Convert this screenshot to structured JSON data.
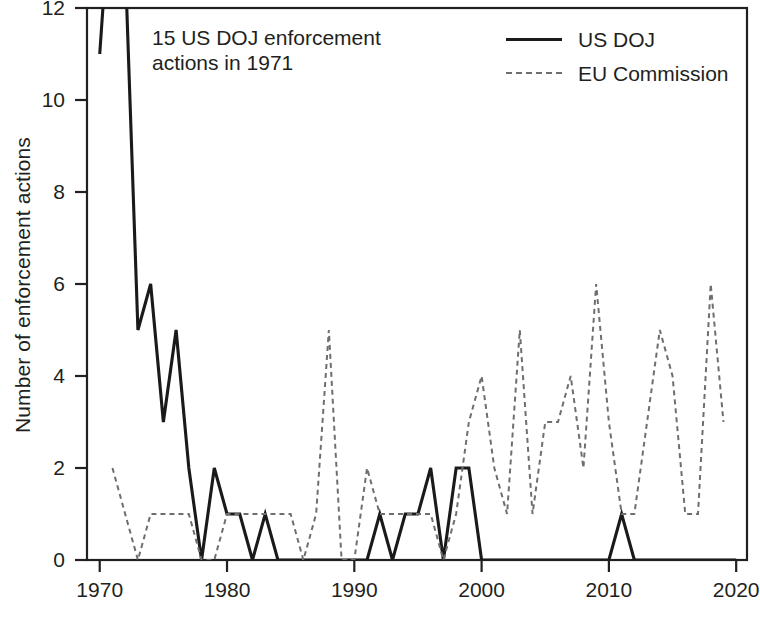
{
  "axes": {
    "ylabel": "Number of enforcement actions",
    "xlabel": "",
    "yticks": [
      0,
      2,
      4,
      6,
      8,
      10,
      12
    ],
    "xticks": [
      1970,
      1980,
      1990,
      2000,
      2010,
      2020
    ],
    "xtick_labels": [
      "1970",
      "1980",
      "1990",
      "2000",
      "2010",
      "2020"
    ],
    "ytick_labels": [
      "0",
      "2",
      "4",
      "6",
      "8",
      "10",
      "12"
    ]
  },
  "annotation": {
    "text": "15 US DOJ enforcement\nactions in 1971"
  },
  "legend": {
    "items": [
      {
        "label": "US DOJ",
        "style": "solid",
        "color": "#1a1a1a"
      },
      {
        "label": "EU Commission",
        "style": "dashed",
        "color": "#6e6e6e"
      }
    ]
  },
  "chart_data": {
    "type": "line",
    "title": "",
    "xlabel": "",
    "ylabel": "Number of enforcement actions",
    "xlim": [
      1969,
      2020
    ],
    "ylim": [
      0,
      12.5
    ],
    "grid": false,
    "legend_position": "top-right",
    "annotations": [
      {
        "text": "15 US DOJ enforcement actions in 1971",
        "x": 1973,
        "y": 11.6
      }
    ],
    "series": [
      {
        "name": "US DOJ",
        "style": "solid",
        "color": "#1a1a1a",
        "x": [
          1970,
          1971,
          1972,
          1973,
          1974,
          1975,
          1976,
          1977,
          1978,
          1979,
          1980,
          1981,
          1982,
          1983,
          1984,
          1985,
          1986,
          1987,
          1988,
          1989,
          1990,
          1991,
          1992,
          1993,
          1994,
          1995,
          1996,
          1997,
          1998,
          1999,
          2000,
          2001,
          2002,
          2003,
          2004,
          2005,
          2006,
          2007,
          2008,
          2009,
          2010,
          2011,
          2012,
          2013,
          2014,
          2015,
          2016,
          2017,
          2018,
          2019,
          2020
        ],
        "values": [
          11,
          15,
          13,
          5,
          6,
          3,
          5,
          2,
          0,
          2,
          1,
          1,
          0,
          1,
          0,
          0,
          0,
          0,
          0,
          0,
          0,
          0,
          1,
          0,
          1,
          1,
          2,
          0,
          2,
          2,
          0,
          0,
          0,
          0,
          0,
          0,
          0,
          0,
          0,
          0,
          0,
          1,
          0,
          0,
          0,
          0,
          0,
          0,
          0,
          0,
          0
        ]
      },
      {
        "name": "EU Commission",
        "style": "dashed",
        "color": "#6e6e6e",
        "x": [
          1971,
          1972,
          1973,
          1974,
          1975,
          1976,
          1977,
          1978,
          1979,
          1980,
          1981,
          1982,
          1983,
          1984,
          1985,
          1986,
          1987,
          1988,
          1989,
          1990,
          1991,
          1992,
          1993,
          1994,
          1995,
          1996,
          1997,
          1998,
          1999,
          2000,
          2001,
          2002,
          2003,
          2004,
          2005,
          2006,
          2007,
          2008,
          2009,
          2010,
          2011,
          2012,
          2013,
          2014,
          2015,
          2016,
          2017,
          2018,
          2019
        ],
        "values": [
          2,
          1,
          0,
          1,
          1,
          1,
          1,
          0,
          0,
          1,
          1,
          1,
          1,
          1,
          1,
          0,
          1,
          5,
          0,
          0,
          2,
          1,
          1,
          1,
          1,
          1,
          0,
          1,
          3,
          4,
          2,
          1,
          5,
          1,
          3,
          3,
          4,
          2,
          6,
          3,
          1,
          1,
          3,
          5,
          4,
          1,
          1,
          6,
          3
        ]
      }
    ]
  }
}
